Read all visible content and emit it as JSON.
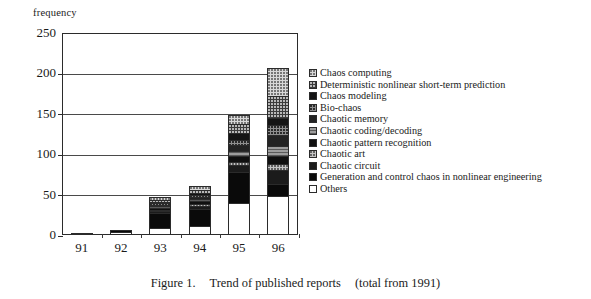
{
  "figure": {
    "caption_label": "Figure 1.",
    "caption_title": "Trend of published reports",
    "caption_note": "(total from 1991)"
  },
  "chart_data": {
    "type": "bar",
    "subtype": "stacked-bar",
    "xlabel": "",
    "ylabel": "frequency",
    "categories": [
      "91",
      "92",
      "93",
      "94",
      "95",
      "96"
    ],
    "ylim": [
      0,
      250
    ],
    "yticks": [
      0,
      50,
      100,
      150,
      200,
      250
    ],
    "grid": true,
    "legend_position": "right",
    "totals": [
      3,
      6,
      47,
      61,
      148,
      207
    ],
    "series": [
      {
        "name": "Chaos computing",
        "pattern": "light-gray-dotted",
        "color": "#d8d8d8",
        "values": [
          0,
          0,
          3,
          5,
          11,
          36
        ]
      },
      {
        "name": "Deterministic nonlinear short-term prediction",
        "pattern": "dark-dotted",
        "color": "#3c3c3c",
        "values": [
          0,
          0,
          2,
          3,
          10,
          28
        ]
      },
      {
        "name": "Chaos modeling",
        "pattern": "solid-black",
        "color": "#141414",
        "values": [
          0,
          0,
          1,
          2,
          8,
          8
        ]
      },
      {
        "name": "Bio-chaos",
        "pattern": "mid-gray-dotted",
        "color": "#8e8e8e",
        "values": [
          0,
          0,
          1,
          2,
          6,
          12
        ]
      },
      {
        "name": "Chaotic memory",
        "pattern": "solid-black",
        "color": "#232323",
        "values": [
          0,
          0,
          1,
          2,
          7,
          14
        ]
      },
      {
        "name": "Chaotic coding/decoding",
        "pattern": "gray-hatched",
        "color": "#9d9d9d",
        "values": [
          0,
          0,
          1,
          2,
          5,
          11
        ]
      },
      {
        "name": "Chaotic pattern recognition",
        "pattern": "solid-black",
        "color": "#101010",
        "values": [
          0,
          0,
          1,
          2,
          7,
          10
        ]
      },
      {
        "name": "Chaotic art",
        "pattern": "light-gray-dotted",
        "color": "#c4c4c4",
        "values": [
          0,
          0,
          1,
          2,
          3,
          6
        ]
      },
      {
        "name": "Chaotic circuit",
        "pattern": "solid-black",
        "color": "#1b1b1b",
        "values": [
          0,
          0,
          2,
          3,
          9,
          18
        ]
      },
      {
        "name": "Generation and control chaos in nonlinear engineering",
        "pattern": "solid-black",
        "color": "#0a0a0a",
        "values": [
          2,
          4,
          25,
          26,
          41,
          14
        ]
      },
      {
        "name": "Others",
        "pattern": "white",
        "color": "#ffffff",
        "values": [
          1,
          2,
          9,
          12,
          41,
          50
        ]
      }
    ]
  },
  "legend": {
    "items": [
      {
        "label": "Chaos computing",
        "swatch": "p-chaos-computing"
      },
      {
        "label": "Deterministic nonlinear short-term prediction",
        "swatch": "p-det-nonlinear"
      },
      {
        "label": "Chaos modeling",
        "swatch": "p-chaos-modeling"
      },
      {
        "label": "Bio-chaos",
        "swatch": "p-bio-chaos"
      },
      {
        "label": "Chaotic memory",
        "swatch": "p-chaotic-memory"
      },
      {
        "label": "Chaotic coding/decoding",
        "swatch": "p-chaotic-coding"
      },
      {
        "label": "Chaotic pattern recognition",
        "swatch": "p-chaotic-pattern"
      },
      {
        "label": "Chaotic art",
        "swatch": "p-chaotic-art"
      },
      {
        "label": "Chaotic circuit",
        "swatch": "p-chaotic-circuit"
      },
      {
        "label": "Generation and control chaos in nonlinear engineering",
        "swatch": "p-generation-control"
      },
      {
        "label": "Others",
        "swatch": "p-others"
      }
    ]
  }
}
